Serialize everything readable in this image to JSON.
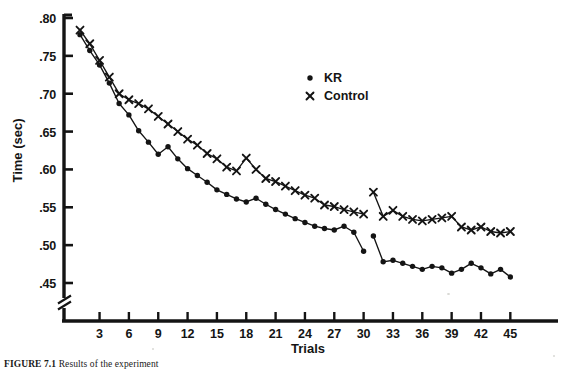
{
  "figure": {
    "caption_label": "FIGURE 7.1",
    "caption_text": "  Results of the experiment"
  },
  "axes": {
    "ylabel": "Time (sec)",
    "xlabel": "Trials",
    "yticks": [
      ".45",
      ".50",
      ".55",
      ".60",
      ".65",
      ".70",
      ".75",
      ".80"
    ],
    "ytick_values": [
      0.45,
      0.5,
      0.55,
      0.6,
      0.65,
      0.7,
      0.75,
      0.8
    ],
    "xticks": [
      "3",
      "6",
      "9",
      "12",
      "15",
      "18",
      "21",
      "24",
      "27",
      "30",
      "33",
      "36",
      "39",
      "42",
      "45"
    ],
    "xtick_values": [
      3,
      6,
      9,
      12,
      15,
      18,
      21,
      24,
      27,
      30,
      33,
      36,
      39,
      42,
      45
    ],
    "y_axis_break": true,
    "y_break_label": "axis-break-mark"
  },
  "legend": {
    "position": "top-right-inside",
    "entries": [
      {
        "marker": "filled-circle",
        "label": "KR"
      },
      {
        "marker": "x-cross",
        "label": "Control"
      }
    ]
  },
  "colors": {
    "ink": "#141414",
    "paper": "#ffffff"
  },
  "chart_data": {
    "type": "line",
    "title": "",
    "xlabel": "Trials",
    "ylabel": "Time (sec)",
    "xlim": [
      0,
      46
    ],
    "ylim": [
      0.435,
      0.805
    ],
    "grid": false,
    "legend_position": "upper right",
    "x_gap_between": [
      30,
      31
    ],
    "series": [
      {
        "name": "KR",
        "marker": "filled-circle",
        "x": [
          1,
          2,
          3,
          4,
          5,
          6,
          7,
          8,
          9,
          10,
          11,
          12,
          13,
          14,
          15,
          16,
          17,
          18,
          19,
          20,
          21,
          22,
          23,
          24,
          25,
          26,
          27,
          28,
          29,
          30,
          31,
          32,
          33,
          34,
          35,
          36,
          37,
          38,
          39,
          40,
          41,
          42,
          43,
          44,
          45
        ],
        "values": [
          0.778,
          0.757,
          0.738,
          0.714,
          0.687,
          0.672,
          0.651,
          0.636,
          0.62,
          0.63,
          0.614,
          0.601,
          0.592,
          0.583,
          0.573,
          0.567,
          0.561,
          0.557,
          0.562,
          0.554,
          0.547,
          0.541,
          0.535,
          0.53,
          0.525,
          0.522,
          0.52,
          0.525,
          0.517,
          0.492,
          0.512,
          0.478,
          0.48,
          0.476,
          0.472,
          0.468,
          0.472,
          0.47,
          0.463,
          0.468,
          0.476,
          0.47,
          0.462,
          0.468,
          0.458
        ]
      },
      {
        "name": "Control",
        "marker": "x-cross",
        "x": [
          1,
          2,
          3,
          4,
          5,
          6,
          7,
          8,
          9,
          10,
          11,
          12,
          13,
          14,
          15,
          16,
          17,
          18,
          19,
          20,
          21,
          22,
          23,
          24,
          25,
          26,
          27,
          28,
          29,
          30,
          31,
          32,
          33,
          34,
          35,
          36,
          37,
          38,
          39,
          40,
          41,
          42,
          43,
          44,
          45
        ],
        "values": [
          0.784,
          0.766,
          0.744,
          0.722,
          0.7,
          0.692,
          0.687,
          0.68,
          0.67,
          0.66,
          0.65,
          0.64,
          0.632,
          0.621,
          0.614,
          0.603,
          0.598,
          0.615,
          0.6,
          0.588,
          0.584,
          0.578,
          0.572,
          0.566,
          0.562,
          0.553,
          0.551,
          0.547,
          0.544,
          0.541,
          0.57,
          0.538,
          0.546,
          0.538,
          0.534,
          0.532,
          0.534,
          0.536,
          0.538,
          0.524,
          0.52,
          0.524,
          0.518,
          0.516,
          0.518
        ]
      }
    ]
  }
}
